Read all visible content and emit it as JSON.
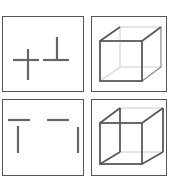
{
  "figure": {
    "layout": "2x2 grid of bordered panels",
    "colors": {
      "border": "#555555",
      "stroke_dark": "#5a5a5a",
      "stroke_faint": "#c8c8c8",
      "background": "#ffffff"
    },
    "panels": [
      {
        "position": "top-left",
        "content": "cross and inverted-T line segments"
      },
      {
        "position": "top-right",
        "content": "wireframe cube (front face emphasized)"
      },
      {
        "position": "bottom-left",
        "content": "separated line fragments (two horizontals, two verticals)"
      },
      {
        "position": "bottom-right",
        "content": "wireframe cube (back-left edges emphasized)"
      }
    ]
  }
}
